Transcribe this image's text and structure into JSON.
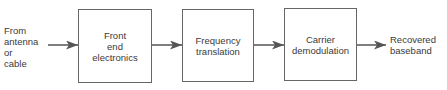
{
  "diagram": {
    "input_label": "From\nantenna\nor\ncable",
    "output_label": "Recovered\nbaseband",
    "blocks": [
      {
        "label": "Front\nend\nelectronics"
      },
      {
        "label": "Frequency\ntranslation"
      },
      {
        "label": "Carrier\ndemodulation"
      }
    ],
    "colors": {
      "stroke": "#666666",
      "text": "#3a3a3a",
      "background": "#ffffff"
    }
  }
}
